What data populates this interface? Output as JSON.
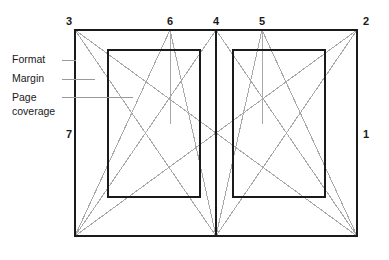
{
  "figure": {
    "colors": {
      "outline": "#1a1a1a",
      "construction": "#a8a8a8",
      "leader": "#9a9a9a",
      "text": "#1a1a1a",
      "background": "#ffffff"
    },
    "corner_numbers": [
      {
        "id": "3",
        "label": "3",
        "x": 69,
        "y": 25,
        "anchor": "middle"
      },
      {
        "id": "6",
        "label": "6",
        "x": 170,
        "y": 25,
        "anchor": "middle"
      },
      {
        "id": "4",
        "label": "4",
        "x": 216,
        "y": 25,
        "anchor": "middle"
      },
      {
        "id": "5",
        "label": "5",
        "x": 262,
        "y": 25,
        "anchor": "middle"
      },
      {
        "id": "2",
        "label": "2",
        "x": 366,
        "y": 25,
        "anchor": "middle"
      },
      {
        "id": "7",
        "label": "7",
        "x": 69,
        "y": 138,
        "anchor": "middle"
      },
      {
        "id": "1",
        "label": "1",
        "x": 366,
        "y": 138,
        "anchor": "middle"
      }
    ],
    "callouts": [
      {
        "id": "format",
        "lines": [
          "Format"
        ],
        "text_x": 12,
        "text_y": 63,
        "leader_x1": 62,
        "leader_y1": 60,
        "leader_x2": 76,
        "leader_y2": 60
      },
      {
        "id": "margin",
        "lines": [
          "Margin"
        ],
        "text_x": 12,
        "text_y": 82,
        "leader_x1": 62,
        "leader_y1": 79,
        "leader_x2": 95,
        "leader_y2": 79
      },
      {
        "id": "page-coverage",
        "lines": [
          "Page",
          "coverage"
        ],
        "text_x": 12,
        "text_y": 101,
        "leader_x1": 62,
        "leader_y1": 97,
        "leader_x2": 133,
        "leader_y2": 97
      }
    ],
    "geometry": {
      "spread": {
        "left": 75,
        "top": 30,
        "right": 357,
        "bottom": 236
      },
      "gutter_x": 216,
      "left_text_block": {
        "left": 108,
        "top": 50,
        "right": 200,
        "bottom": 197
      },
      "right_text_block": {
        "left": 233,
        "top": 50,
        "right": 325,
        "bottom": 197
      },
      "point_6_x": 170,
      "point_5_x": 262
    },
    "construction_lines": [
      {
        "id": "diag-3-to-4",
        "x1": 75,
        "y1": 30,
        "x2": 216,
        "y2": 236
      },
      {
        "id": "diag-7-to-4-top",
        "x1": 75,
        "y1": 236,
        "x2": 216,
        "y2": 30
      },
      {
        "id": "diag-4-to-2",
        "x1": 216,
        "y1": 30,
        "x2": 357,
        "y2": 236
      },
      {
        "id": "diag-4-to-1",
        "x1": 216,
        "y1": 236,
        "x2": 357,
        "y2": 30
      },
      {
        "id": "diag-3-to-2-full",
        "x1": 75,
        "y1": 30,
        "x2": 357,
        "y2": 236
      },
      {
        "id": "diag-7-to-2-full",
        "x1": 75,
        "y1": 236,
        "x2": 357,
        "y2": 30
      },
      {
        "id": "diag-6-to-4-down",
        "x1": 170,
        "y1": 30,
        "x2": 216,
        "y2": 236
      },
      {
        "id": "diag-5-to-4-down",
        "x1": 262,
        "y1": 30,
        "x2": 216,
        "y2": 236
      },
      {
        "id": "diag-6-to-7",
        "x1": 170,
        "y1": 30,
        "x2": 75,
        "y2": 236
      },
      {
        "id": "diag-5-to-1",
        "x1": 262,
        "y1": 30,
        "x2": 357,
        "y2": 236
      },
      {
        "id": "vert-6",
        "x1": 170,
        "y1": 30,
        "x2": 170,
        "y2": 124
      },
      {
        "id": "vert-5",
        "x1": 262,
        "y1": 30,
        "x2": 262,
        "y2": 124
      }
    ]
  }
}
